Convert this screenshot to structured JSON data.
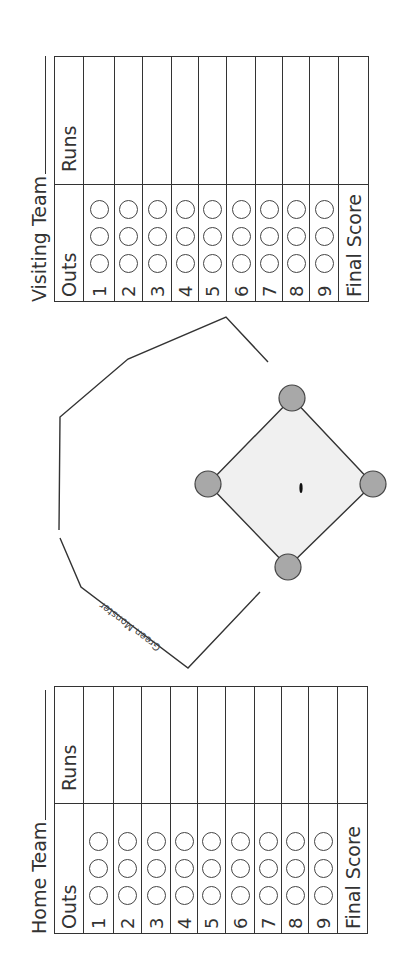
{
  "visiting": {
    "title": "Visiting Team",
    "header_outs": "Outs",
    "header_runs": "Runs",
    "innings": [
      "1",
      "2",
      "3",
      "4",
      "5",
      "6",
      "7",
      "8",
      "9"
    ],
    "final_label": "Final Score"
  },
  "home": {
    "title": "Home Team",
    "header_outs": "Outs",
    "header_runs": "Runs",
    "innings": [
      "1",
      "2",
      "3",
      "4",
      "5",
      "6",
      "7",
      "8",
      "9"
    ],
    "final_label": "Final Score"
  },
  "field": {
    "wall_label": "Green Monster",
    "colors": {
      "infield_fill": "#f0f0f0",
      "base_fill": "#a8a8a8",
      "line": "#333333"
    }
  }
}
